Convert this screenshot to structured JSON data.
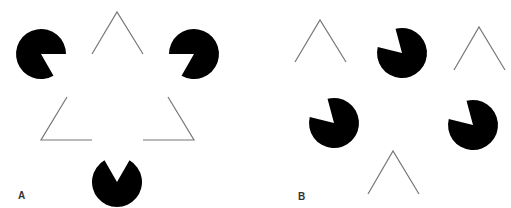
{
  "figure": {
    "background": "#ffffff",
    "shape_color": "#000000",
    "line_color": "#777777",
    "pacman_radius": 25,
    "panels": [
      {
        "label": "A",
        "label_pos": [
          18,
          191
        ],
        "pacmen": [
          {
            "cx": 41,
            "cy": 54,
            "mouth_start": 0,
            "mouth_end": 60
          },
          {
            "cx": 194,
            "cy": 54,
            "mouth_start": 120,
            "mouth_end": 180
          },
          {
            "cx": 117,
            "cy": 182,
            "mouth_start": -120,
            "mouth_end": -60
          }
        ],
        "polylines": [
          [
            [
              92,
              54
            ],
            [
              117,
              12
            ],
            [
              143,
              54
            ]
          ],
          [
            [
              67,
              97
            ],
            [
              41,
              140
            ],
            [
              92,
              140
            ]
          ],
          [
            [
              168,
              97
            ],
            [
              194,
              140
            ],
            [
              143,
              140
            ]
          ]
        ]
      },
      {
        "label": "B",
        "label_pos": [
          298,
          192
        ],
        "pacmen": [
          {
            "cx": 402,
            "cy": 53,
            "mouth_start": -166,
            "mouth_end": -105
          },
          {
            "cx": 334,
            "cy": 123,
            "mouth_start": -166,
            "mouth_end": -105
          },
          {
            "cx": 473,
            "cy": 125,
            "mouth_start": -166,
            "mouth_end": -105
          }
        ],
        "polylines": [
          [
            [
              295,
              62
            ],
            [
              320,
              20
            ],
            [
              346,
              62
            ]
          ],
          [
            [
              454,
              70
            ],
            [
              479,
              27
            ],
            [
              505,
              70
            ]
          ],
          [
            [
              368,
              194
            ],
            [
              393,
              151
            ],
            [
              419,
              194
            ]
          ]
        ]
      }
    ]
  }
}
